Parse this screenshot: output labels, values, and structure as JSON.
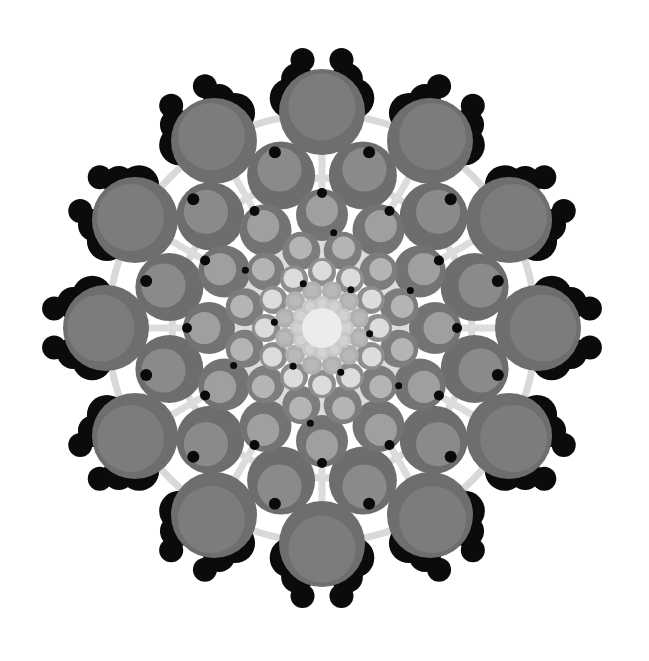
{
  "image": {
    "width": 649,
    "height": 661,
    "background": "#ffffff",
    "center": [
      322,
      328
    ],
    "description": "Radial mandala pattern of grey concentric circles with black bead clusters"
  },
  "guide_rings": {
    "color": "#d9d9d9",
    "stroke_width": 7,
    "radii": [
      214,
      150
    ]
  },
  "spokes": {
    "color": "#dcdcdc",
    "count": 12,
    "offset_deg": 0,
    "inner": 40,
    "outer": 200,
    "width": 7
  },
  "rings": [
    {
      "name": "ring-outer",
      "count": 12,
      "radius": 216,
      "offset_deg": 0,
      "size": 43,
      "outer_color": "#6e6e6e",
      "inner_color": "#7c7c7c",
      "inner_scale": 0.78,
      "inner_shift": 0.12
    },
    {
      "name": "ring-2",
      "count": 12,
      "radius": 158,
      "offset_deg": 15,
      "size": 34,
      "outer_color": "#6d6d6d",
      "inner_color": "#8a8a8a",
      "inner_scale": 0.65,
      "inner_shift": 0.18
    },
    {
      "name": "ring-3",
      "count": 12,
      "radius": 113,
      "offset_deg": 0,
      "size": 26,
      "outer_color": "#737373",
      "inner_color": "#9f9f9f",
      "inner_scale": 0.62,
      "inner_shift": 0.18
    },
    {
      "name": "ring-4",
      "count": 12,
      "radius": 80,
      "offset_deg": 15,
      "size": 19,
      "outer_color": "#7d7d7d",
      "inner_color": "#b4b4b4",
      "inner_scale": 0.6,
      "inner_shift": 0.16
    },
    {
      "name": "ring-5",
      "count": 12,
      "radius": 56,
      "offset_deg": 0,
      "size": 14,
      "outer_color": "#8e8e8e",
      "inner_color": "#dcdcdc",
      "inner_scale": 0.7,
      "inner_shift": 0.1
    },
    {
      "name": "ring-6",
      "count": 12,
      "radius": 38,
      "offset_deg": 15,
      "size": 10,
      "outer_color": "#b0b0b0",
      "inner_color": "#b9b9b9",
      "inner_scale": 0.6,
      "inner_shift": 0.05
    },
    {
      "name": "ring-7",
      "count": 12,
      "radius": 24,
      "offset_deg": 0,
      "size": 8,
      "outer_color": "#c8c8c8",
      "inner_color": "#d2d2d2",
      "inner_scale": 0.6,
      "inner_shift": 0.05
    }
  ],
  "core": {
    "radius": 20,
    "color": "#ececec"
  },
  "black_dots": [
    {
      "name": "dots-outer",
      "count": 12,
      "radius": 182,
      "offset_deg": 15,
      "size": 6,
      "color": "#0a0a0a"
    },
    {
      "name": "dots-mid",
      "count": 12,
      "radius": 135,
      "offset_deg": 0,
      "size": 5,
      "color": "#0a0a0a"
    },
    {
      "name": "dots-inner",
      "count": 6,
      "radius": 96,
      "offset_deg": 7,
      "size": 3.5,
      "color": "#0a0a0a"
    },
    {
      "name": "dots-core",
      "count": 6,
      "radius": 48,
      "offset_deg": 37,
      "size": 3.5,
      "color": "#0a0a0a"
    }
  ],
  "bead_clusters": {
    "count": 12,
    "offset_deg": 15,
    "color": "#0b0b0b",
    "beads": [
      {
        "radius": 232,
        "tangent": 0,
        "size": 20
      },
      {
        "radius": 250,
        "tangent": 10,
        "size": 16
      },
      {
        "radius": 268,
        "tangent": 18,
        "size": 12
      }
    ]
  }
}
